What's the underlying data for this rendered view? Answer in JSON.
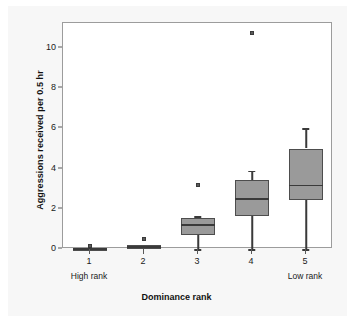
{
  "chart_data": {
    "type": "boxplot",
    "title": "",
    "xlabel": "Dominance rank",
    "ylabel": "Aggressions received per 0.5 hr",
    "categories": [
      "1",
      "2",
      "3",
      "4",
      "5"
    ],
    "category_sub_labels": {
      "1": "High rank",
      "5": "Low rank"
    },
    "ylim": [
      -0.35,
      11.3
    ],
    "yticks": [
      0,
      2,
      4,
      6,
      8,
      10
    ],
    "ytick_labels": [
      "0",
      "2",
      "4",
      "6",
      "8",
      "10"
    ],
    "xlim": [
      0.5,
      5.5
    ],
    "grid": false,
    "legend": null,
    "box_fill_color": "#9a9a9a",
    "box_edge_color": "#4d4d4d",
    "whisker_color": "#3a3a3a",
    "plot_background": "#ffffff",
    "figure_background": "#f7f7f7",
    "boxes": [
      {
        "category": "1",
        "whisker_low": 0.0,
        "q1": 0.0,
        "median": 0.0,
        "q3": 0.04,
        "whisker_high": 0.04,
        "outliers": [
          0.15
        ]
      },
      {
        "category": "2",
        "whisker_low": 0.0,
        "q1": 0.0,
        "median": 0.1,
        "q3": 0.22,
        "whisker_high": 0.22,
        "outliers": [
          0.5
        ]
      },
      {
        "category": "3",
        "whisker_low": 0.0,
        "q1": 0.7,
        "median": 1.2,
        "q3": 1.52,
        "whisker_high": 1.62,
        "outliers": [
          3.2
        ]
      },
      {
        "category": "4",
        "whisker_low": 0.0,
        "q1": 1.65,
        "median": 2.5,
        "q3": 3.45,
        "whisker_high": 3.9,
        "outliers": [
          10.75
        ]
      },
      {
        "category": "5",
        "whisker_low": 0.0,
        "q1": 2.45,
        "median": 3.15,
        "q3": 5.0,
        "whisker_high": 6.0,
        "outliers": []
      }
    ]
  }
}
